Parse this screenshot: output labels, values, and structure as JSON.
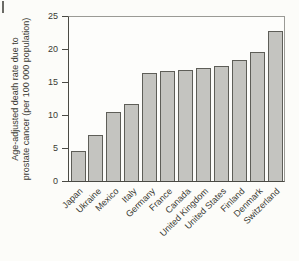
{
  "figure": {
    "colors": {
      "background": "#fcfcf9",
      "bar_fill": "#c4c4c0",
      "bar_border": "#5e5e58",
      "axis": "#4a4a44",
      "frame": "#9a9a95",
      "text": "#3a3a33"
    }
  },
  "chart_data": {
    "type": "bar",
    "title": "",
    "xlabel": "",
    "ylabel": "Age-adjusted death rate due to prostate cancer (per 100 000 population)",
    "ylabel_lines": [
      "Age-adjusted death rate due to",
      "prostate cancer (per 100 000 population)"
    ],
    "categories": [
      "Japan",
      "Ukraine",
      "Mexico",
      "Italy",
      "Germany",
      "France",
      "Canada",
      "United Kingdom",
      "United States",
      "Finland",
      "Denmark",
      "Switzerland"
    ],
    "values": [
      4.6,
      7.0,
      10.6,
      11.8,
      16.5,
      16.8,
      17.0,
      17.2,
      17.6,
      18.4,
      19.6,
      22.8
    ],
    "yticks": [
      0,
      5,
      10,
      15,
      20,
      25
    ],
    "ylim": [
      0,
      25
    ],
    "grid": false,
    "legend": "none",
    "bar_orientation": "vertical",
    "xtick_rotation_deg": 45
  }
}
